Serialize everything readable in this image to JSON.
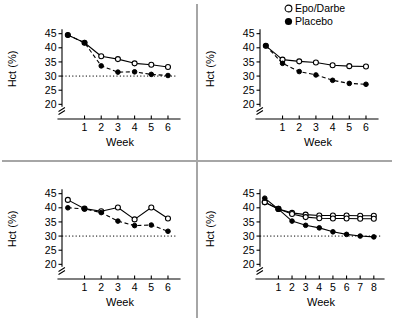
{
  "legend": {
    "position": "top-right",
    "entries": [
      {
        "label": "Epo/Darbe",
        "marker": "open-circle"
      },
      {
        "label": "Placebo",
        "marker": "filled-circle"
      }
    ]
  },
  "axis": {
    "ylabel": "Hct (%)",
    "xlabel": "Week",
    "yticks": [
      20,
      25,
      30,
      35,
      40,
      45
    ],
    "ylim": [
      18,
      47
    ],
    "reference_line_value": 30,
    "axis_break": true
  },
  "chart_data": [
    {
      "type": "line",
      "panel": "top-left",
      "title": "",
      "xlabel": "Week",
      "ylabel": "Hct (%)",
      "xticks": [
        1,
        2,
        3,
        4,
        5,
        6
      ],
      "xlim": [
        -0.35,
        6.6
      ],
      "ylim": [
        18,
        47
      ],
      "yticks": [
        20,
        25,
        30,
        35,
        40,
        45
      ],
      "grid": false,
      "reference_line": 30,
      "series": [
        {
          "name": "Epo/Darbe",
          "marker": "open-circle",
          "line": "solid",
          "x": [
            0,
            1,
            2,
            3,
            4,
            5,
            6
          ],
          "values": [
            44.5,
            41.8,
            37.0,
            36.0,
            34.5,
            34.0,
            33.2
          ]
        },
        {
          "name": "Placebo",
          "marker": "filled-circle",
          "line": "dashed",
          "x": [
            0,
            1,
            2,
            3,
            4,
            5,
            6
          ],
          "values": [
            44.5,
            41.8,
            33.6,
            31.4,
            31.5,
            30.6,
            30.2
          ]
        }
      ]
    },
    {
      "type": "line",
      "panel": "top-right",
      "title": "",
      "xlabel": "Week",
      "ylabel": "Hct (%)",
      "xticks": [
        1,
        2,
        3,
        4,
        5,
        6
      ],
      "xlim": [
        -0.35,
        6.6
      ],
      "ylim": [
        18,
        47
      ],
      "yticks": [
        20,
        25,
        30,
        35,
        40,
        45
      ],
      "grid": false,
      "reference_line": null,
      "series": [
        {
          "name": "Epo/Darbe",
          "marker": "open-circle",
          "line": "solid",
          "x": [
            0,
            1,
            2,
            3,
            4,
            5,
            6
          ],
          "values": [
            40.7,
            35.8,
            35.2,
            34.8,
            33.8,
            33.5,
            33.4
          ]
        },
        {
          "name": "Placebo",
          "marker": "filled-circle",
          "line": "dashed",
          "x": [
            0,
            1,
            2,
            3,
            4,
            5,
            6
          ],
          "values": [
            40.7,
            34.5,
            31.6,
            30.4,
            28.5,
            27.4,
            27.1
          ]
        }
      ]
    },
    {
      "type": "line",
      "panel": "bottom-left",
      "title": "",
      "xlabel": "Week",
      "ylabel": "Hct (%)",
      "xticks": [
        1,
        2,
        3,
        4,
        5,
        6
      ],
      "xlim": [
        -0.35,
        6.6
      ],
      "ylim": [
        18,
        47
      ],
      "yticks": [
        20,
        25,
        30,
        35,
        40,
        45
      ],
      "grid": false,
      "reference_line": 30,
      "series": [
        {
          "name": "Epo/Darbe",
          "marker": "open-circle",
          "line": "solid",
          "x": [
            0,
            1,
            2,
            3,
            4,
            5,
            6
          ],
          "values": [
            42.8,
            39.7,
            38.8,
            40.1,
            35.9,
            40.1,
            36.2
          ]
        },
        {
          "name": "Placebo",
          "marker": "filled-circle",
          "line": "dashed",
          "x": [
            0,
            1,
            2,
            3,
            4,
            5,
            6
          ],
          "values": [
            40.0,
            39.6,
            38.3,
            35.3,
            33.7,
            33.9,
            31.7
          ]
        }
      ]
    },
    {
      "type": "line",
      "panel": "bottom-right",
      "title": "",
      "xlabel": "Week",
      "ylabel": "Hct (%)",
      "xticks": [
        1,
        2,
        3,
        4,
        5,
        6,
        7,
        8
      ],
      "xlim": [
        -0.35,
        8.6
      ],
      "ylim": [
        18,
        47
      ],
      "yticks": [
        20,
        25,
        30,
        35,
        40,
        45
      ],
      "grid": false,
      "reference_line": 30,
      "series": [
        {
          "name": "Epo/Darbe",
          "marker": "open-circle",
          "line": "solid",
          "x": [
            0,
            1,
            2,
            3,
            4,
            5,
            6,
            7,
            8
          ],
          "values": [
            42.0,
            39.6,
            38.2,
            37.6,
            37.3,
            37.3,
            37.3,
            37.2,
            37.2
          ]
        },
        {
          "name": "Epo/Darbe",
          "marker": "open-circle",
          "line": "solid",
          "x": [
            0,
            1,
            2,
            3,
            4,
            5,
            6,
            7,
            8
          ],
          "values": [
            42.0,
            39.6,
            37.8,
            36.7,
            36.3,
            36.2,
            36.2,
            36.1,
            36.1
          ]
        },
        {
          "name": "Placebo",
          "marker": "filled-circle",
          "line": "solid",
          "x": [
            0,
            1,
            2,
            3,
            4,
            5,
            6,
            7,
            8
          ],
          "values": [
            43.4,
            39.5,
            35.3,
            33.8,
            32.9,
            31.5,
            30.6,
            30.0,
            29.7
          ]
        }
      ]
    }
  ]
}
